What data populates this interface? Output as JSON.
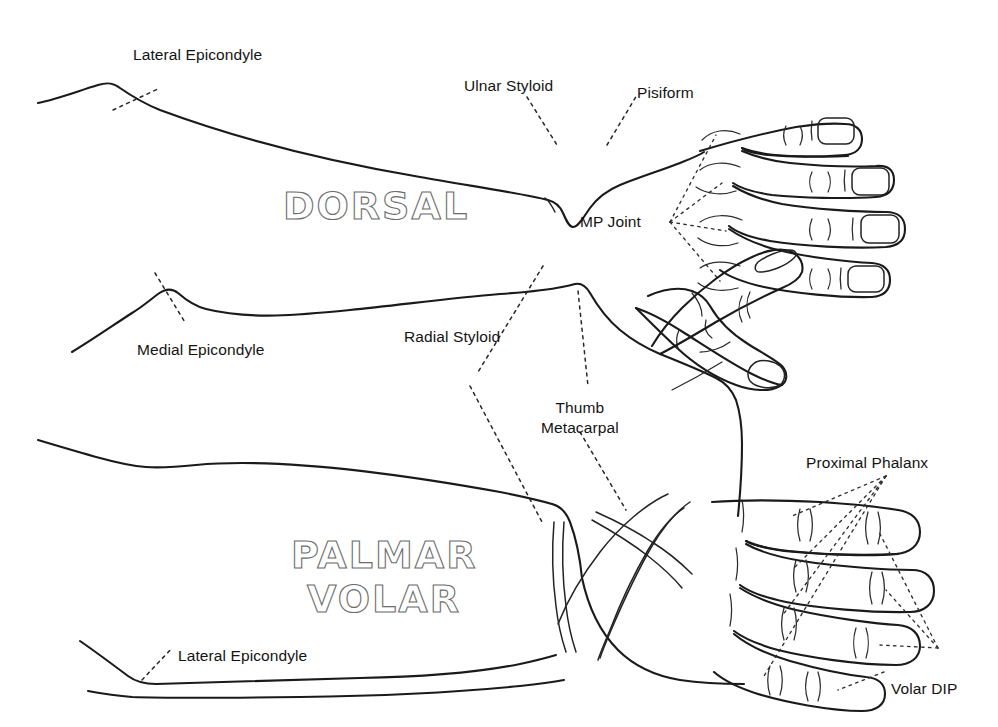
{
  "figure": {
    "background_color": "#ffffff",
    "ink_color": "#1a1a1a",
    "outline_text_color": "#6d6d6d",
    "width": 998,
    "height": 727
  },
  "views": [
    {
      "id": "dorsal",
      "name": "DORSAL",
      "heading": "DORSAL",
      "heading_style": "outline",
      "description": "Dorsal (back) view of right forearm, wrist and hand"
    },
    {
      "id": "palmar",
      "name": "PALMAR VOLAR",
      "heading_line_1": "PALMAR",
      "heading_line_2": "VOLAR",
      "heading_style": "outline",
      "description": "Palmar (volar) view of right forearm, wrist and hand"
    }
  ],
  "labels": [
    {
      "id": "lateral-epicondyle-dorsal",
      "text": "Lateral Epicondyle",
      "view": "dorsal",
      "x": 133,
      "y": 45
    },
    {
      "id": "ulnar-styloid",
      "text": "Ulnar Styloid",
      "view": "dorsal",
      "x": 464,
      "y": 76
    },
    {
      "id": "pisiform",
      "text": "Pisiform",
      "view": "dorsal",
      "x": 637,
      "y": 83
    },
    {
      "id": "mp-joint",
      "text": "MP Joint",
      "view": "dorsal",
      "x": 580,
      "y": 212
    },
    {
      "id": "medial-epicondyle",
      "text": "Medial Epicondyle",
      "view": "palmar",
      "x": 137,
      "y": 340
    },
    {
      "id": "radial-styloid",
      "text": "Radial Styloid",
      "view": "palmar",
      "x": 404,
      "y": 327
    },
    {
      "id": "thumb-metacarpal",
      "text": "Thumb\nMetacarpal",
      "view": "palmar",
      "x": 541,
      "y": 398
    },
    {
      "id": "proximal-phalanx",
      "text": "Proximal Phalanx",
      "view": "palmar",
      "x": 806,
      "y": 453
    },
    {
      "id": "volar-dip",
      "text": "Volar DIP",
      "view": "palmar",
      "x": 891,
      "y": 679
    },
    {
      "id": "lateral-epicondyle-palmar",
      "text": "Lateral Epicondyle",
      "view": "palmar",
      "x": 178,
      "y": 646
    }
  ],
  "landmarks": [
    {
      "id": "lateral-epicondyle",
      "label": "Lateral Epicondyle",
      "region": "elbow"
    },
    {
      "id": "medial-epicondyle",
      "label": "Medial Epicondyle",
      "region": "elbow"
    },
    {
      "id": "ulnar-styloid",
      "label": "Ulnar Styloid",
      "region": "wrist"
    },
    {
      "id": "radial-styloid",
      "label": "Radial Styloid",
      "region": "wrist"
    },
    {
      "id": "pisiform",
      "label": "Pisiform",
      "region": "wrist"
    },
    {
      "id": "mp-joint",
      "label": "MP Joint",
      "region": "hand"
    },
    {
      "id": "thumb-metacarpal",
      "label": "Thumb Metacarpal",
      "region": "hand"
    },
    {
      "id": "proximal-phalanx",
      "label": "Proximal Phalanx",
      "region": "fingers"
    },
    {
      "id": "volar-dip",
      "label": "Volar DIP",
      "region": "fingers"
    }
  ],
  "digits": {
    "dorsal_finger_count": 4,
    "dorsal_has_thumb": true,
    "palmar_finger_count": 4,
    "palmar_has_thumb": true,
    "dorsal_nails_visible": 4,
    "dorsal_thumb_nail_visible": true
  }
}
